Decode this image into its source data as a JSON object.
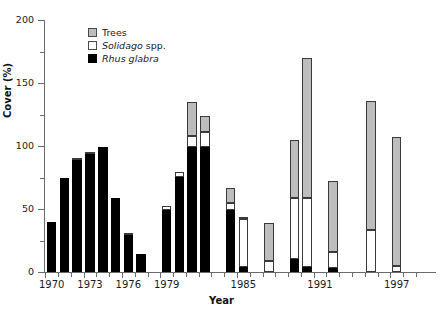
{
  "chart_data": {
    "type": "bar",
    "subtype": "stacked-bar",
    "title": "",
    "xlabel": "Year",
    "ylabel": "Cover (%)",
    "ylim": [
      0,
      200
    ],
    "ytick_values": [
      0,
      50,
      100,
      150,
      200
    ],
    "ytick_labels": [
      "0",
      "50",
      "100",
      "150",
      "200"
    ],
    "yminor_step": 25,
    "xlim": [
      1969.4,
      2000.0
    ],
    "xtick_labels": [
      "1970",
      "1973",
      "1976",
      "1979",
      "1985",
      "1991",
      "1997"
    ],
    "xtick_values": [
      1970,
      1973,
      1976,
      1979,
      1985,
      1991,
      1997
    ],
    "grid": false,
    "legend_position": "top-left",
    "categories": [
      1970,
      1971,
      1972,
      1973,
      1974,
      1975,
      1976,
      1977,
      1978,
      1979,
      1980,
      1981,
      1982,
      1984,
      1985,
      1986,
      1987,
      1989,
      1990,
      1991,
      1992,
      1993,
      1994,
      1995,
      1996,
      1997,
      1998,
      1999
    ],
    "series": [
      {
        "name": "Rhus glabra",
        "color": "#000000",
        "values": [
          40,
          75,
          89,
          94,
          99,
          59,
          29,
          14,
          49,
          75,
          99,
          99,
          49,
          4,
          0,
          0,
          10,
          4,
          3,
          0,
          0,
          0,
          0,
          0,
          0,
          0,
          0,
          0
        ]
      },
      {
        "name": "Solidago spp.",
        "color": "#ffffff",
        "values": [
          0,
          0,
          1,
          1,
          0,
          0,
          2,
          0,
          3,
          4,
          9,
          12,
          6,
          38,
          9,
          0,
          49,
          55,
          13,
          0,
          33,
          5,
          0,
          0,
          0,
          0,
          0,
          0
        ]
      },
      {
        "name": "Trees",
        "color": "#bdbdbd",
        "values": [
          0,
          0,
          0,
          0,
          0,
          0,
          0,
          0,
          0,
          0,
          27,
          13,
          12,
          1,
          30,
          46,
          46,
          111,
          56,
          103,
          103,
          102,
          0,
          0,
          0,
          0,
          0,
          0
        ]
      }
    ],
    "bars": [
      {
        "year": 1970,
        "rhus": 40,
        "solidago": 0,
        "trees": 0,
        "total": 40
      },
      {
        "year": 1971,
        "rhus": 75,
        "solidago": 0,
        "trees": 0,
        "total": 75
      },
      {
        "year": 1972,
        "rhus": 89,
        "solidago": 1,
        "trees": 0,
        "total": 90
      },
      {
        "year": 1973,
        "rhus": 94,
        "solidago": 1,
        "trees": 0,
        "total": 95
      },
      {
        "year": 1974,
        "rhus": 99,
        "solidago": 0,
        "trees": 0,
        "total": 99
      },
      {
        "year": 1975,
        "rhus": 59,
        "solidago": 0,
        "trees": 0,
        "total": 59
      },
      {
        "year": 1976,
        "rhus": 29,
        "solidago": 2,
        "trees": 0,
        "total": 31
      },
      {
        "year": 1977,
        "rhus": 14,
        "solidago": 0,
        "trees": 0,
        "total": 14
      },
      {
        "year": 1979,
        "rhus": 49,
        "solidago": 3,
        "trees": 0,
        "total": 52
      },
      {
        "year": 1980,
        "rhus": 75,
        "solidago": 4,
        "trees": 0,
        "total": 79
      },
      {
        "year": 1981,
        "rhus": 99,
        "solidago": 9,
        "trees": 27,
        "total": 135
      },
      {
        "year": 1982,
        "rhus": 99,
        "solidago": 12,
        "trees": 13,
        "total": 124
      },
      {
        "year": 1984,
        "rhus": 49,
        "solidago": 6,
        "trees": 12,
        "total": 67
      },
      {
        "year": 1985,
        "rhus": 4,
        "solidago": 38,
        "trees": 1,
        "total": 43
      },
      {
        "year": 1987,
        "rhus": 0,
        "solidago": 9,
        "trees": 30,
        "total": 39
      },
      {
        "year": 1989,
        "rhus": 10,
        "solidago": 49,
        "trees": 46,
        "total": 105
      },
      {
        "year": 1990,
        "rhus": 4,
        "solidago": 55,
        "trees": 111,
        "total": 170
      },
      {
        "year": 1992,
        "rhus": 3,
        "solidago": 13,
        "trees": 56,
        "total": 72
      },
      {
        "year": 1995,
        "rhus": 0,
        "solidago": 33,
        "trees": 103,
        "total": 136
      },
      {
        "year": 1997,
        "rhus": 0,
        "solidago": 5,
        "trees": 102,
        "total": 107
      }
    ]
  },
  "legend": {
    "items": [
      {
        "label": "Trees",
        "label_italic": "",
        "swatch": "trees-swatch"
      },
      {
        "label": " spp.",
        "label_italic": "Solidago",
        "swatch": "solidago-swatch"
      },
      {
        "label": "",
        "label_italic": "Rhus glabra",
        "swatch": "rhus-swatch"
      }
    ]
  }
}
